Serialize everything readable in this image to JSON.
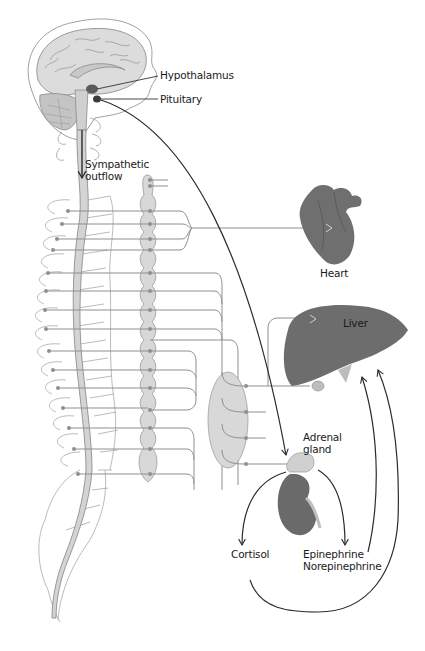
{
  "diagram": {
    "type": "anatomical-flow",
    "labels": {
      "hypothalamus": "Hypothalamus",
      "pituitary": "Pituitary",
      "sympathetic_outflow_line1": "Sympathetic",
      "sympathetic_outflow_line2": "outflow",
      "heart": "Heart",
      "liver": "Liver",
      "adrenal_line1": "Adrenal",
      "adrenal_line2": "gland",
      "cortisol": "Cortisol",
      "epinephrine": "Epinephrine",
      "norepinephrine": "Norepinephrine"
    },
    "nodes": [
      {
        "id": "brain",
        "name": "Brain (sagittal section)"
      },
      {
        "id": "hypothalamus",
        "name": "Hypothalamus"
      },
      {
        "id": "pituitary",
        "name": "Pituitary"
      },
      {
        "id": "spinal-cord",
        "name": "Spinal cord"
      },
      {
        "id": "sympathetic-chain",
        "name": "Sympathetic ganglion chain"
      },
      {
        "id": "celiac-ganglion",
        "name": "Prevertebral ganglion"
      },
      {
        "id": "heart",
        "name": "Heart"
      },
      {
        "id": "liver",
        "name": "Liver"
      },
      {
        "id": "adrenal",
        "name": "Adrenal gland"
      },
      {
        "id": "kidney",
        "name": "Kidney"
      }
    ],
    "edges": [
      {
        "from": "pituitary",
        "to": "adrenal",
        "style": "dark-arrow"
      },
      {
        "from": "hypothalamus",
        "to": "spinal-cord",
        "label": "Sympathetic outflow"
      },
      {
        "from": "sympathetic-chain",
        "to": "heart",
        "style": "grey-nerve"
      },
      {
        "from": "celiac-ganglion",
        "to": "liver",
        "style": "grey-nerve"
      },
      {
        "from": "celiac-ganglion",
        "to": "adrenal",
        "style": "grey-nerve"
      },
      {
        "from": "adrenal",
        "to": "cortisol",
        "style": "dark-arrow"
      },
      {
        "from": "adrenal",
        "to": "epinephrine-norepinephrine",
        "style": "dark-arrow"
      },
      {
        "from": "cortisol",
        "to": "liver",
        "style": "dark-arrow"
      },
      {
        "from": "epinephrine-norepinephrine",
        "to": "liver",
        "style": "dark-arrow"
      }
    ],
    "colors": {
      "organ_dark": "#6b6b6b",
      "nerve_grey": "#8f8f8f",
      "fill_light": "#d9d9d9",
      "arrow_dark": "#2b2b2b",
      "outline": "#9a9a9a"
    }
  }
}
